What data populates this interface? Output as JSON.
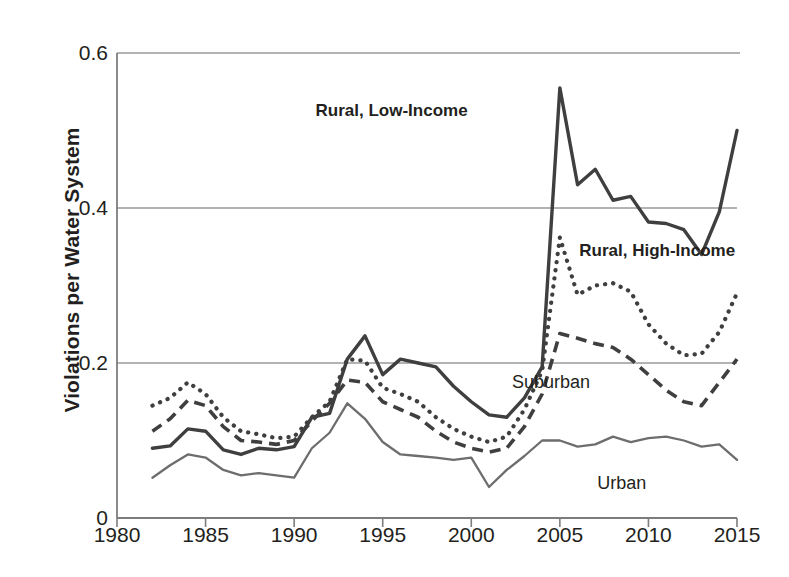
{
  "chart_data": {
    "type": "line",
    "title": "",
    "xlabel": "",
    "ylabel": "Violations per Water System",
    "xlim": [
      1980,
      2015
    ],
    "ylim": [
      0,
      0.6
    ],
    "xticks": [
      1980,
      1985,
      1990,
      1995,
      2000,
      2005,
      2010,
      2015
    ],
    "yticks": [
      0,
      0.2,
      0.4,
      0.6
    ],
    "ytick_labels": [
      "0",
      "0.2",
      "0.4",
      "0.6"
    ],
    "xtick_labels": [
      "1980",
      "1985",
      "1990",
      "1995",
      "2000",
      "2005",
      "2010",
      "2015"
    ],
    "grid": "horizontal",
    "legend": "inline-annotations",
    "x": [
      1982,
      1983,
      1984,
      1985,
      1986,
      1987,
      1988,
      1989,
      1990,
      1991,
      1992,
      1993,
      1994,
      1995,
      1996,
      1997,
      1998,
      1999,
      2000,
      2001,
      2002,
      2003,
      2004,
      2005,
      2006,
      2007,
      2008,
      2009,
      2010,
      2011,
      2012,
      2013,
      2014,
      2015
    ],
    "series": [
      {
        "name": "Rural, Low-Income",
        "style": "solid-thick",
        "color": "#3f3f3f",
        "values": [
          0.09,
          0.093,
          0.115,
          0.112,
          0.088,
          0.082,
          0.09,
          0.088,
          0.092,
          0.13,
          0.135,
          0.205,
          0.235,
          0.185,
          0.205,
          0.2,
          0.195,
          0.17,
          0.15,
          0.133,
          0.13,
          0.155,
          0.195,
          0.555,
          0.43,
          0.45,
          0.41,
          0.415,
          0.382,
          0.38,
          0.372,
          0.34,
          0.395,
          0.5
        ]
      },
      {
        "name": "Rural, High-Income",
        "style": "dotted",
        "color": "#3f3f3f",
        "values": [
          0.145,
          0.155,
          0.175,
          0.16,
          0.13,
          0.112,
          0.108,
          0.103,
          0.105,
          0.13,
          0.15,
          0.205,
          0.203,
          0.168,
          0.16,
          0.15,
          0.13,
          0.115,
          0.105,
          0.098,
          0.105,
          0.14,
          0.19,
          0.362,
          0.288,
          0.3,
          0.303,
          0.292,
          0.25,
          0.225,
          0.21,
          0.212,
          0.24,
          0.29
        ]
      },
      {
        "name": "Suburban",
        "style": "dashed",
        "color": "#3f3f3f",
        "values": [
          0.112,
          0.128,
          0.152,
          0.145,
          0.118,
          0.1,
          0.098,
          0.095,
          0.1,
          0.125,
          0.148,
          0.178,
          0.175,
          0.15,
          0.14,
          0.13,
          0.112,
          0.098,
          0.09,
          0.085,
          0.09,
          0.118,
          0.16,
          0.238,
          0.232,
          0.225,
          0.22,
          0.205,
          0.185,
          0.165,
          0.15,
          0.145,
          0.175,
          0.205
        ]
      },
      {
        "name": "Urban",
        "style": "solid-thin",
        "color": "#6d6d6d",
        "values": [
          0.052,
          0.068,
          0.082,
          0.078,
          0.062,
          0.055,
          0.058,
          0.055,
          0.052,
          0.09,
          0.11,
          0.148,
          0.128,
          0.098,
          0.082,
          0.08,
          0.078,
          0.075,
          0.078,
          0.04,
          0.062,
          0.08,
          0.1,
          0.1,
          0.092,
          0.095,
          0.105,
          0.098,
          0.103,
          0.105,
          0.1,
          0.092,
          0.095,
          0.075
        ]
      }
    ],
    "annotations": [
      {
        "text": "Rural, Low-Income",
        "x": 1995.5,
        "y": 0.525
      },
      {
        "text": "Rural, High-Income",
        "x": 2010.5,
        "y": 0.345
      },
      {
        "text": "Suburban",
        "x": 2004.5,
        "y": 0.175
      },
      {
        "text": "Urban",
        "x": 2008.5,
        "y": 0.045
      }
    ]
  },
  "axis": {
    "y_title": "Violations per Water System"
  }
}
